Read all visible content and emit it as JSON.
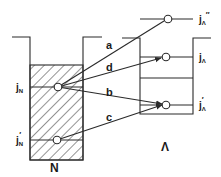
{
  "diagram": {
    "type": "energy-level transition diagram",
    "wells": [
      {
        "id": "N",
        "label": "N",
        "hatched": true
      },
      {
        "id": "Lambda",
        "label": "Λ",
        "hatched": false
      }
    ],
    "levels": {
      "jN": {
        "main": "j",
        "sub": "N",
        "prime": ""
      },
      "jN_prime": {
        "main": "j",
        "sub": "N",
        "prime": "′"
      },
      "jL": {
        "main": "j",
        "sub": "Λ",
        "prime": ""
      },
      "jL_prime": {
        "main": "j",
        "sub": "Λ",
        "prime": "′"
      },
      "jL_dprime": {
        "main": "j",
        "sub": "Λ",
        "prime": "″"
      }
    },
    "transitions": [
      {
        "label": "a",
        "from": "jN",
        "to": "jL_dprime"
      },
      {
        "label": "d",
        "from": "jN",
        "to": "jL"
      },
      {
        "label": "b",
        "from": "jN",
        "to": "jL_prime"
      },
      {
        "label": "c",
        "from": "jN_prime",
        "to": "jL_prime"
      }
    ],
    "colors": {
      "ink": "#2a2a2a",
      "background": "#ffffff"
    }
  }
}
